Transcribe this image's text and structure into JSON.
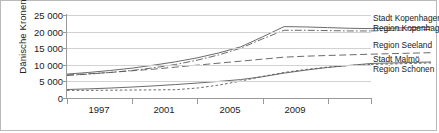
{
  "chart_data": {
    "type": "line",
    "title": "",
    "xlabel": "",
    "ylabel": "Dänische Kronen",
    "xlim": [
      1996,
      2010
    ],
    "ylim": [
      0,
      25000
    ],
    "grid": true,
    "legend_position": "right",
    "x": [
      1996,
      1997,
      1998,
      1999,
      2000,
      2001,
      2002,
      2003,
      2004,
      2005,
      2006,
      2007,
      2008,
      2009,
      2010
    ],
    "ytick_labels": [
      "0",
      "5 000",
      "10 000",
      "15 000",
      "20 000",
      "25 000"
    ],
    "ytick_values": [
      0,
      5000,
      10000,
      15000,
      20000,
      25000
    ],
    "xtick_labels": [
      "1997",
      "2001",
      "2005",
      "2009"
    ],
    "xtick_values": [
      1997,
      2001,
      2005,
      2009
    ],
    "series": [
      {
        "name": "Stadt Kopenhagen",
        "style": "solid",
        "values": [
          7200,
          7700,
          8300,
          9000,
          9900,
          10900,
          12100,
          13600,
          15400,
          18400,
          21500,
          21400,
          21200,
          21000,
          20900
        ]
      },
      {
        "name": "Region Kopenhagen",
        "style": "dash-dot",
        "values": [
          6800,
          7200,
          7700,
          8300,
          9100,
          10100,
          11400,
          13000,
          15000,
          17800,
          20400,
          20400,
          20300,
          20200,
          20200
        ]
      },
      {
        "name": "Region Seeland",
        "style": "long-dash",
        "values": [
          6900,
          7300,
          7700,
          8200,
          8700,
          9300,
          9900,
          10500,
          11100,
          11700,
          12300,
          12600,
          12800,
          13000,
          13200
        ]
      },
      {
        "name": "Stadt Malmö",
        "style": "short-dash",
        "values": [
          2300,
          2300,
          2350,
          2400,
          2450,
          2500,
          3000,
          3900,
          5100,
          6500,
          7700,
          8600,
          9300,
          9800,
          10100
        ]
      },
      {
        "name": "Region Schonen",
        "style": "solid",
        "values": [
          2550,
          2750,
          3000,
          3300,
          3650,
          4050,
          4500,
          5000,
          5550,
          6400,
          7500,
          8400,
          9200,
          9800,
          10400
        ]
      }
    ],
    "legend_entries": [
      "Stadt Kopenhagen",
      "Region Kopenhagen",
      "Region Seeland",
      "Stadt Malmö",
      "Region Schonen"
    ],
    "colors": {
      "line": "#5a5a5a",
      "grid": "#d2d2d2",
      "axis": "#9a9a9a",
      "text": "#1a1a1a",
      "border": "#b9b9b9",
      "background": "#ffffff"
    }
  }
}
